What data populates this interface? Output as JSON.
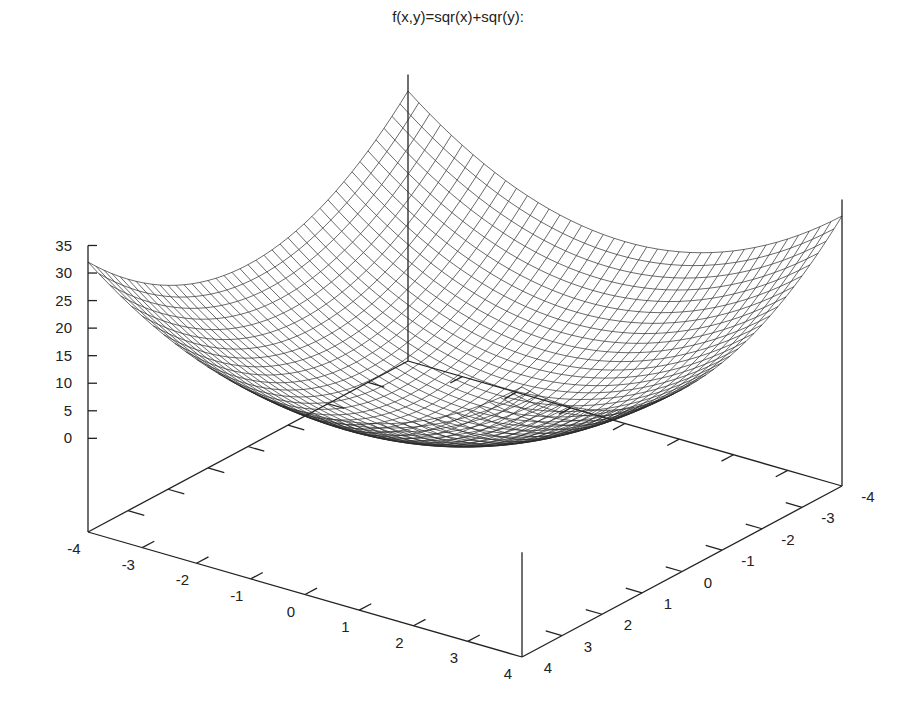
{
  "chart_data": {
    "type": "surface",
    "title": "f(x,y)=sqr(x)+sqr(y):",
    "function": "x^2 + y^2",
    "xlabel": "",
    "ylabel": "",
    "zlabel": "",
    "xrange": [
      -4,
      4
    ],
    "yrange": [
      -4,
      4
    ],
    "zrange": [
      -17,
      35
    ],
    "x_ticks": [
      "-4",
      "-3",
      "-2",
      "-1",
      "0",
      "1",
      "2",
      "3",
      "4"
    ],
    "x_tick_values": [
      -4,
      -3,
      -2,
      -1,
      0,
      1,
      2,
      3,
      4
    ],
    "y_ticks": [
      "-4",
      "-3",
      "-2",
      "-1",
      "0",
      "1",
      "2",
      "3",
      "4"
    ],
    "y_tick_values": [
      -4,
      -3,
      -2,
      -1,
      0,
      1,
      2,
      3,
      4
    ],
    "z_ticks": [
      "0",
      "5",
      "10",
      "15",
      "20",
      "25",
      "30",
      "35"
    ],
    "z_tick_values": [
      0,
      5,
      10,
      15,
      20,
      25,
      30,
      35
    ],
    "grid_samples": 40,
    "style": "wireframe mesh",
    "line_color": "#2a2a2a",
    "axis_color": "#222222",
    "legend": "none"
  }
}
